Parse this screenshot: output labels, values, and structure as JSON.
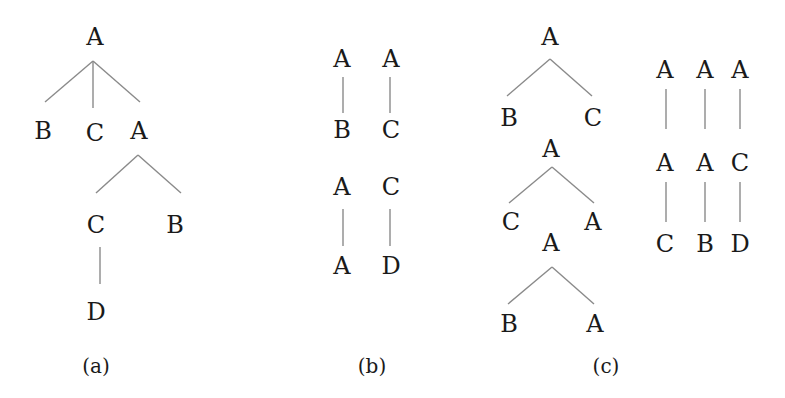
{
  "figure": {
    "panels": [
      {
        "caption": "(a)",
        "trees": [
          {
            "nodes": [
              {
                "id": "a_root",
                "label": "A",
                "x": 95,
                "y": 38
              },
              {
                "id": "a_b1",
                "label": "B",
                "x": 43,
                "y": 132
              },
              {
                "id": "a_c1",
                "label": "C",
                "x": 95,
                "y": 134
              },
              {
                "id": "a_a2",
                "label": "A",
                "x": 139,
                "y": 132
              },
              {
                "id": "a_c2",
                "label": "C",
                "x": 96,
                "y": 226
              },
              {
                "id": "a_b2",
                "label": "B",
                "x": 175,
                "y": 226
              },
              {
                "id": "a_d",
                "label": "D",
                "x": 96,
                "y": 313
              }
            ],
            "edges": [
              {
                "from": "a_root",
                "to": "a_b1",
                "x1": 93,
                "y1": 61,
                "x2": 45,
                "y2": 102
              },
              {
                "from": "a_root",
                "to": "a_c1",
                "x1": 93,
                "y1": 61,
                "x2": 93,
                "y2": 108
              },
              {
                "from": "a_root",
                "to": "a_a2",
                "x1": 93,
                "y1": 61,
                "x2": 140,
                "y2": 102
              },
              {
                "from": "a_a2",
                "to": "a_c2",
                "x1": 138,
                "y1": 155,
                "x2": 96,
                "y2": 193
              },
              {
                "from": "a_a2",
                "to": "a_b2",
                "x1": 138,
                "y1": 155,
                "x2": 181,
                "y2": 193
              },
              {
                "from": "a_c2",
                "to": "a_d",
                "x1": 100,
                "y1": 247,
                "x2": 100,
                "y2": 284
              }
            ]
          }
        ],
        "caption_pos": {
          "x": 96,
          "y": 367
        }
      },
      {
        "caption": "(b)",
        "trees": [
          {
            "nodes": [
              {
                "id": "b1_top",
                "label": "A",
                "x": 342,
                "y": 60
              },
              {
                "id": "b1_bot",
                "label": "B",
                "x": 342,
                "y": 131
              }
            ],
            "edges": [
              {
                "x1": 343,
                "y1": 77,
                "x2": 343,
                "y2": 113
              }
            ]
          },
          {
            "nodes": [
              {
                "id": "b2_top",
                "label": "A",
                "x": 391,
                "y": 60
              },
              {
                "id": "b2_bot",
                "label": "C",
                "x": 391,
                "y": 131
              }
            ],
            "edges": [
              {
                "x1": 390,
                "y1": 77,
                "x2": 390,
                "y2": 113
              }
            ]
          },
          {
            "nodes": [
              {
                "id": "b3_top",
                "label": "A",
                "x": 342,
                "y": 188
              },
              {
                "id": "b3_bot",
                "label": "A",
                "x": 342,
                "y": 267
              }
            ],
            "edges": [
              {
                "x1": 343,
                "y1": 209,
                "x2": 343,
                "y2": 246
              }
            ]
          },
          {
            "nodes": [
              {
                "id": "b4_top",
                "label": "C",
                "x": 391,
                "y": 188
              },
              {
                "id": "b4_bot",
                "label": "D",
                "x": 391,
                "y": 267
              }
            ],
            "edges": [
              {
                "x1": 390,
                "y1": 209,
                "x2": 390,
                "y2": 246
              }
            ]
          }
        ],
        "caption_pos": {
          "x": 372,
          "y": 367
        }
      },
      {
        "caption": "(c)",
        "trees": [
          {
            "nodes": [
              {
                "id": "c1_root",
                "label": "A",
                "x": 550,
                "y": 38
              },
              {
                "id": "c1_l",
                "label": "B",
                "x": 509,
                "y": 119
              },
              {
                "id": "c1_r",
                "label": "C",
                "x": 593,
                "y": 119
              }
            ],
            "edges": [
              {
                "x1": 550,
                "y1": 59,
                "x2": 507,
                "y2": 96
              },
              {
                "x1": 550,
                "y1": 59,
                "x2": 592,
                "y2": 96
              }
            ]
          },
          {
            "nodes": [
              {
                "id": "c2_root",
                "label": "A",
                "x": 551,
                "y": 150
              },
              {
                "id": "c2_l",
                "label": "C",
                "x": 511,
                "y": 223
              },
              {
                "id": "c2_r",
                "label": "A",
                "x": 593,
                "y": 223
              }
            ],
            "edges": [
              {
                "x1": 552,
                "y1": 167,
                "x2": 509,
                "y2": 203
              },
              {
                "x1": 552,
                "y1": 167,
                "x2": 594,
                "y2": 203
              }
            ]
          },
          {
            "nodes": [
              {
                "id": "c3_root",
                "label": "A",
                "x": 551,
                "y": 244
              },
              {
                "id": "c3_l",
                "label": "B",
                "x": 509,
                "y": 325
              },
              {
                "id": "c3_r",
                "label": "A",
                "x": 595,
                "y": 325
              }
            ],
            "edges": [
              {
                "x1": 552,
                "y1": 267,
                "x2": 508,
                "y2": 304
              },
              {
                "x1": 552,
                "y1": 267,
                "x2": 594,
                "y2": 304
              }
            ]
          },
          {
            "nodes": [
              {
                "id": "c4_top",
                "label": "A",
                "x": 665,
                "y": 71
              },
              {
                "id": "c4_mid",
                "label": "A",
                "x": 665,
                "y": 164
              },
              {
                "id": "c4_bot",
                "label": "C",
                "x": 665,
                "y": 245
              }
            ],
            "edges": [
              {
                "x1": 666,
                "y1": 89,
                "x2": 666,
                "y2": 129
              },
              {
                "x1": 666,
                "y1": 182,
                "x2": 666,
                "y2": 222
              }
            ]
          },
          {
            "nodes": [
              {
                "id": "c5_top",
                "label": "A",
                "x": 705,
                "y": 71
              },
              {
                "id": "c5_mid",
                "label": "A",
                "x": 705,
                "y": 164
              },
              {
                "id": "c5_bot",
                "label": "B",
                "x": 705,
                "y": 245
              }
            ],
            "edges": [
              {
                "x1": 705,
                "y1": 89,
                "x2": 705,
                "y2": 129
              },
              {
                "x1": 705,
                "y1": 182,
                "x2": 705,
                "y2": 222
              }
            ]
          },
          {
            "nodes": [
              {
                "id": "c6_top",
                "label": "A",
                "x": 740,
                "y": 71
              },
              {
                "id": "c6_mid",
                "label": "C",
                "x": 740,
                "y": 164
              },
              {
                "id": "c6_bot",
                "label": "D",
                "x": 740,
                "y": 245
              }
            ],
            "edges": [
              {
                "x1": 740,
                "y1": 89,
                "x2": 740,
                "y2": 129
              },
              {
                "x1": 740,
                "y1": 182,
                "x2": 740,
                "y2": 222
              }
            ]
          }
        ],
        "caption_pos": {
          "x": 606,
          "y": 367
        }
      }
    ]
  }
}
